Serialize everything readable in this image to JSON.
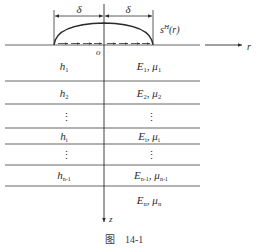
{
  "figure": {
    "caption_prefix": "图",
    "caption_number": "14-1"
  },
  "load": {
    "dimension_left": "δ",
    "dimension_right": "δ",
    "pressure_label": "s",
    "pressure_sup": "H",
    "pressure_arg": "(r)",
    "origin_label": "o"
  },
  "axes": {
    "r_label": "r",
    "z_label": "z"
  },
  "layers": [
    {
      "thickness": "h",
      "thickness_sub": "1",
      "modulus": "E",
      "modulus_sub": "1",
      "poisson": "μ",
      "poisson_sub": "1"
    },
    {
      "thickness": "h",
      "thickness_sub": "2",
      "modulus": "E",
      "modulus_sub": "2",
      "poisson": "μ",
      "poisson_sub": "2"
    },
    {
      "ellipsis_left": "⋮",
      "ellipsis_right": "⋮"
    },
    {
      "thickness": "h",
      "thickness_sub": "i",
      "modulus": "E",
      "modulus_sub": "i",
      "poisson": "μ",
      "poisson_sub": "i"
    },
    {
      "ellipsis_left": "⋮",
      "ellipsis_right": "⋮"
    },
    {
      "thickness": "h",
      "thickness_sub": "n-1",
      "modulus": "E",
      "modulus_sub": "n-1",
      "poisson": "μ",
      "poisson_sub": "n-1"
    },
    {
      "modulus": "E",
      "modulus_sub": "n",
      "poisson": "μ",
      "poisson_sub": "n"
    }
  ],
  "separator": ","
}
